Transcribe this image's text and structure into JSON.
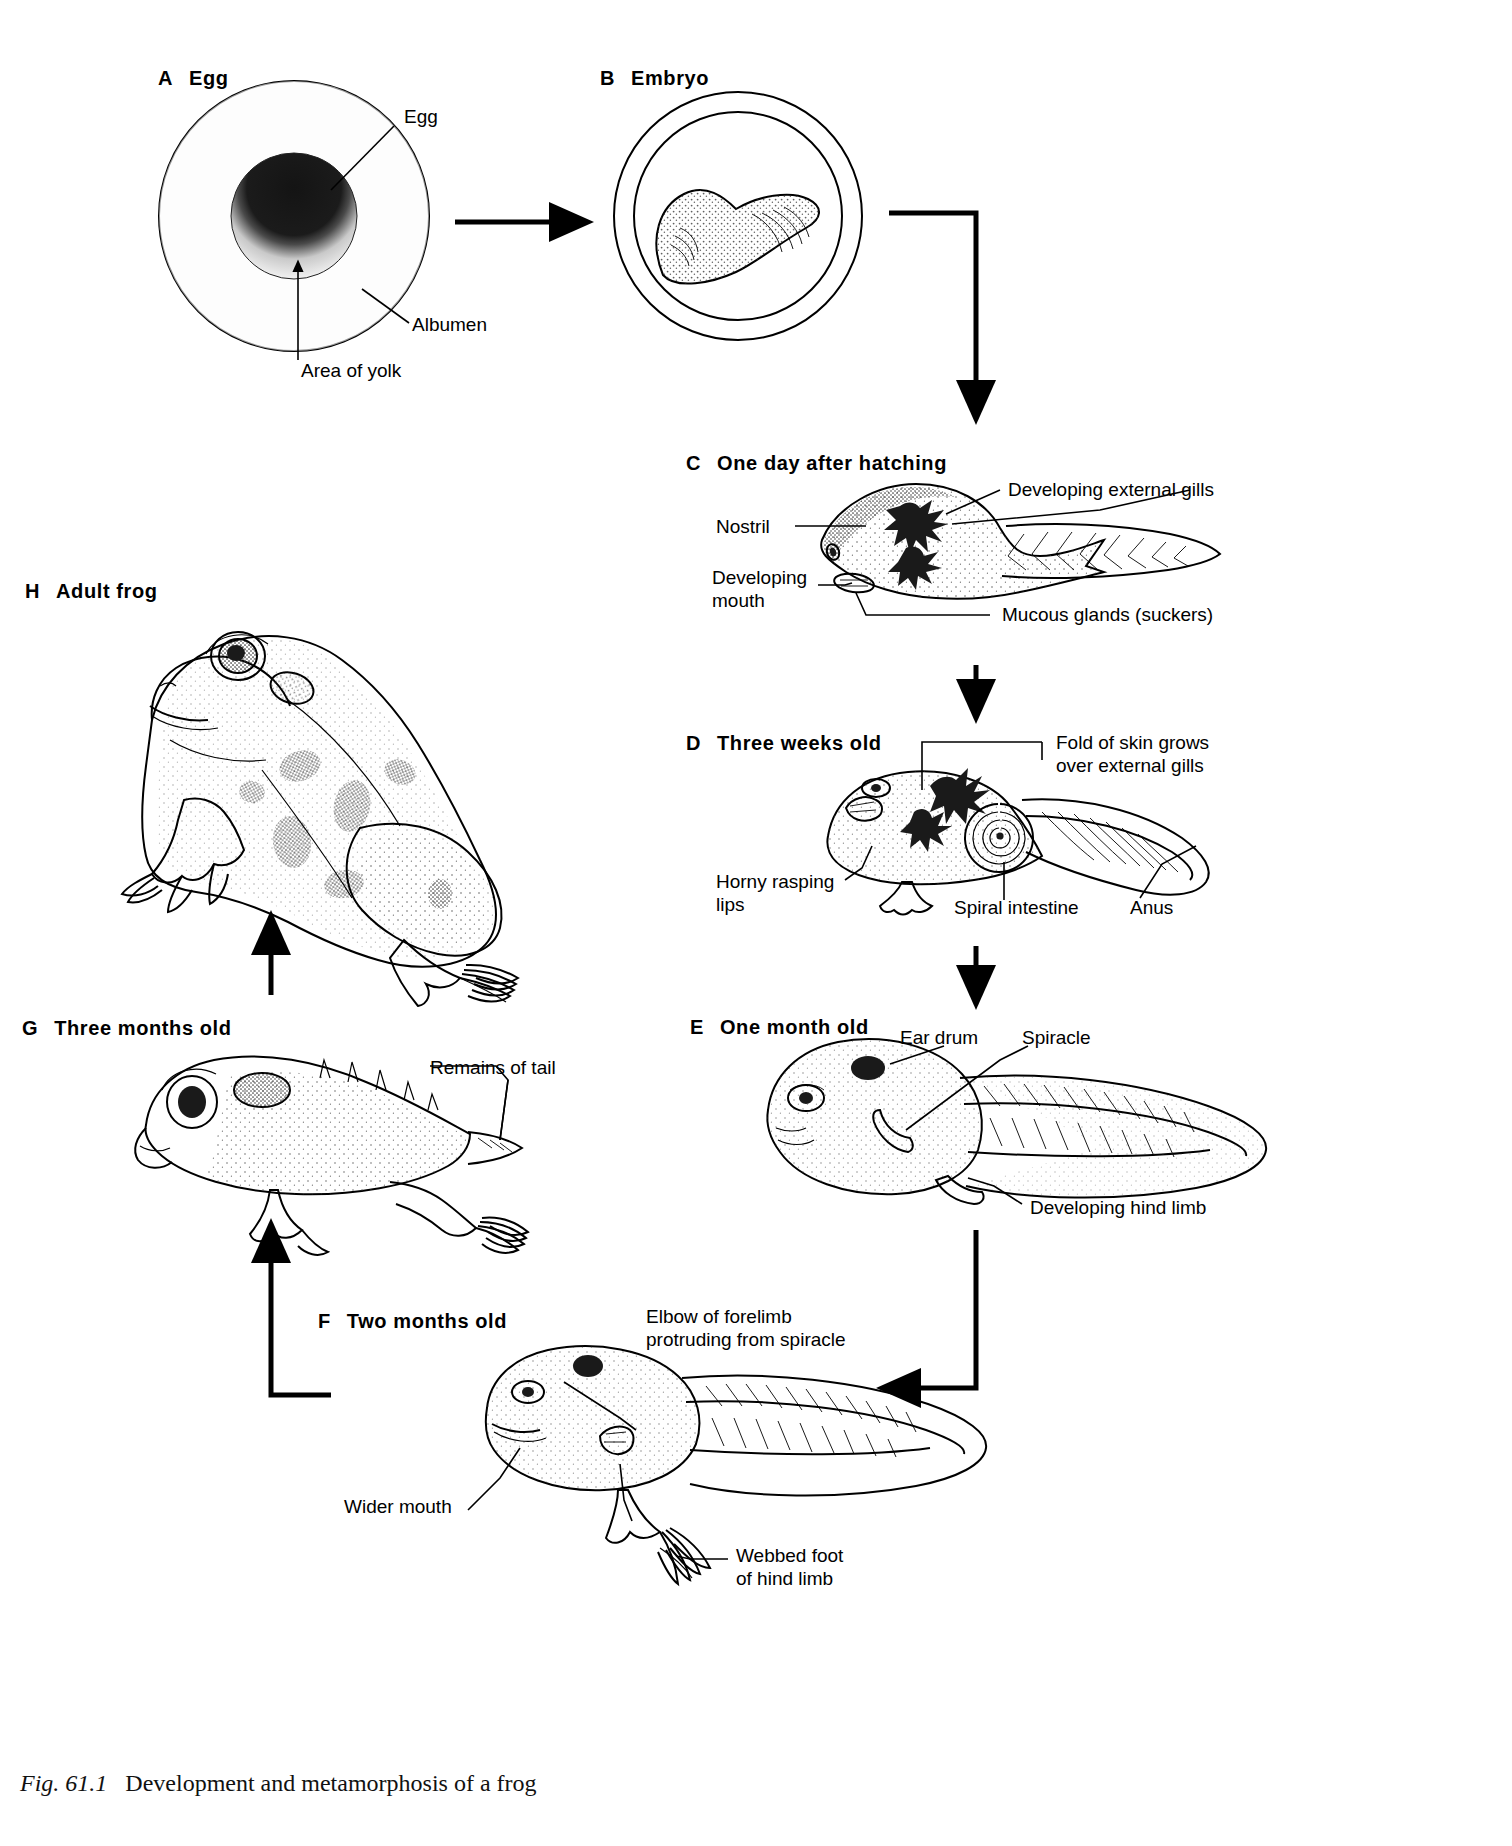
{
  "figure": {
    "number": "Fig. 61.1",
    "caption": "Development and metamorphosis of a frog"
  },
  "stages": [
    {
      "letter": "A",
      "title": "Egg"
    },
    {
      "letter": "B",
      "title": "Embryo"
    },
    {
      "letter": "C",
      "title": "One day after hatching"
    },
    {
      "letter": "D",
      "title": "Three weeks old"
    },
    {
      "letter": "E",
      "title": "One month old"
    },
    {
      "letter": "F",
      "title": "Two months old"
    },
    {
      "letter": "G",
      "title": "Three months old"
    },
    {
      "letter": "H",
      "title": "Adult frog"
    }
  ],
  "annotations": {
    "a_egg": "Egg",
    "a_albumen": "Albumen",
    "a_area_of_yolk": "Area of yolk",
    "c_nostril": "Nostril",
    "c_developing_mouth_line1": "Developing",
    "c_developing_mouth_line2": "mouth",
    "c_developing_external_gills": "Developing external gills",
    "c_mucous_glands": "Mucous glands (suckers)",
    "d_fold_of_skin_line1": "Fold of skin grows",
    "d_fold_of_skin_line2": "over external gills",
    "d_horny_rasping_line1": "Horny rasping",
    "d_horny_rasping_line2": "lips",
    "d_spiral_intestine": "Spiral intestine",
    "d_anus": "Anus",
    "e_ear_drum": "Ear drum",
    "e_spiracle": "Spiracle",
    "e_developing_hind_limb": "Developing hind limb",
    "f_elbow_line1": "Elbow of forelimb",
    "f_elbow_line2": "protruding from spiracle",
    "f_wider_mouth": "Wider mouth",
    "f_webbed_foot_line1": "Webbed foot",
    "f_webbed_foot_line2": "of hind limb",
    "g_remains_of_tail": "Remains of tail"
  },
  "colors": {
    "ink": "#000000",
    "paper": "#ffffff",
    "yolk_dark": "#1a1a1a"
  },
  "flow": [
    {
      "from": "A",
      "to": "B"
    },
    {
      "from": "B",
      "to": "C"
    },
    {
      "from": "C",
      "to": "D"
    },
    {
      "from": "D",
      "to": "E"
    },
    {
      "from": "E",
      "to": "F"
    },
    {
      "from": "F",
      "to": "G"
    },
    {
      "from": "G",
      "to": "H"
    }
  ]
}
